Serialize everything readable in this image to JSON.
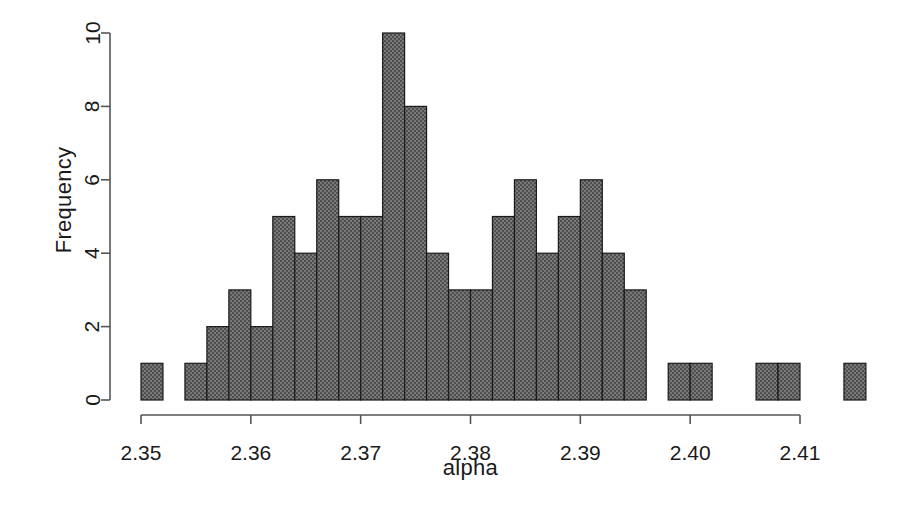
{
  "chart_data": {
    "type": "bar",
    "chart_subtype": "histogram",
    "title": "",
    "xlabel": "alpha",
    "ylabel": "Frequency",
    "xlim": [
      2.3495,
      2.4165
    ],
    "ylim": [
      0,
      10
    ],
    "grid": false,
    "legend": null,
    "bar_fill": "#6b6b6b",
    "bar_edge": "#1a1a1a",
    "bin_width": 0.002,
    "bin_start": 2.35,
    "x_ticks": [
      2.35,
      2.36,
      2.37,
      2.38,
      2.39,
      2.4,
      2.41
    ],
    "x_tick_labels": [
      "2.35",
      "2.36",
      "2.37",
      "2.38",
      "2.39",
      "2.40",
      "2.41"
    ],
    "y_ticks": [
      0,
      2,
      4,
      6,
      8,
      10
    ],
    "y_tick_labels": [
      "0",
      "2",
      "4",
      "6",
      "8",
      "10"
    ],
    "bins": [
      {
        "left": 2.35,
        "right": 2.352,
        "count": 1
      },
      {
        "left": 2.352,
        "right": 2.354,
        "count": 0
      },
      {
        "left": 2.354,
        "right": 2.356,
        "count": 1
      },
      {
        "left": 2.356,
        "right": 2.358,
        "count": 2
      },
      {
        "left": 2.358,
        "right": 2.36,
        "count": 3
      },
      {
        "left": 2.36,
        "right": 2.362,
        "count": 2
      },
      {
        "left": 2.362,
        "right": 2.364,
        "count": 5
      },
      {
        "left": 2.364,
        "right": 2.366,
        "count": 4
      },
      {
        "left": 2.366,
        "right": 2.368,
        "count": 6
      },
      {
        "left": 2.368,
        "right": 2.37,
        "count": 5
      },
      {
        "left": 2.37,
        "right": 2.372,
        "count": 5
      },
      {
        "left": 2.372,
        "right": 2.374,
        "count": 10
      },
      {
        "left": 2.374,
        "right": 2.376,
        "count": 8
      },
      {
        "left": 2.376,
        "right": 2.378,
        "count": 4
      },
      {
        "left": 2.378,
        "right": 2.38,
        "count": 3
      },
      {
        "left": 2.38,
        "right": 2.382,
        "count": 3
      },
      {
        "left": 2.382,
        "right": 2.384,
        "count": 5
      },
      {
        "left": 2.384,
        "right": 2.386,
        "count": 6
      },
      {
        "left": 2.386,
        "right": 2.388,
        "count": 4
      },
      {
        "left": 2.388,
        "right": 2.39,
        "count": 5
      },
      {
        "left": 2.39,
        "right": 2.392,
        "count": 6
      },
      {
        "left": 2.392,
        "right": 2.394,
        "count": 4
      },
      {
        "left": 2.394,
        "right": 2.396,
        "count": 3
      },
      {
        "left": 2.396,
        "right": 2.398,
        "count": 0
      },
      {
        "left": 2.398,
        "right": 2.4,
        "count": 1
      },
      {
        "left": 2.4,
        "right": 2.402,
        "count": 1
      },
      {
        "left": 2.402,
        "right": 2.404,
        "count": 0
      },
      {
        "left": 2.404,
        "right": 2.406,
        "count": 0
      },
      {
        "left": 2.406,
        "right": 2.408,
        "count": 1
      },
      {
        "left": 2.408,
        "right": 2.41,
        "count": 1
      },
      {
        "left": 2.41,
        "right": 2.412,
        "count": 0
      },
      {
        "left": 2.412,
        "right": 2.414,
        "count": 0
      },
      {
        "left": 2.414,
        "right": 2.416,
        "count": 1
      }
    ]
  }
}
